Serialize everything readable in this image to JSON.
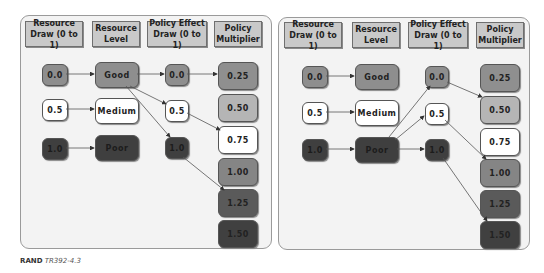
{
  "headers": {
    "resource_draw": "Resource\nDraw (0 to 1)",
    "resource_level": "Resource\nLevel",
    "policy_effect_draw": "Policy Effect\nDraw (0 to 1)",
    "policy_multiplier": "Policy\nMultiplier"
  },
  "left": {
    "draws": [
      "0.0",
      "0.5",
      "1.0"
    ],
    "levels": [
      "Good",
      "Medium",
      "Poor"
    ],
    "policy_draws": [
      "0.0",
      "0.5",
      "1.0"
    ],
    "multipliers": [
      "0.25",
      "0.50",
      "0.75",
      "1.00",
      "1.25",
      "1.50"
    ]
  },
  "right": {
    "draws": [
      "0.0",
      "0.5",
      "1.0"
    ],
    "levels": [
      "Good",
      "Medium",
      "Poor"
    ],
    "policy_draws": [
      "0.0",
      "0.5",
      "1.0"
    ],
    "multipliers": [
      "0.25",
      "0.50",
      "0.75",
      "1.00",
      "1.25",
      "1.50"
    ]
  },
  "diagram": {
    "left_edges": [
      [
        "Draw 0.0",
        "Good"
      ],
      [
        "Draw 0.5",
        "Medium"
      ],
      [
        "Draw 1.0",
        "Poor"
      ],
      [
        "Good",
        "Policy 0.0"
      ],
      [
        "Good",
        "Policy 0.5"
      ],
      [
        "Good",
        "Policy 1.0"
      ],
      [
        "Policy 0.0",
        "0.25"
      ],
      [
        "Policy 0.5",
        "0.75"
      ],
      [
        "Policy 1.0",
        "1.25"
      ]
    ],
    "right_edges": [
      [
        "Draw 0.0",
        "Good"
      ],
      [
        "Draw 0.5",
        "Medium"
      ],
      [
        "Draw 1.0",
        "Poor"
      ],
      [
        "Poor",
        "Policy 0.0"
      ],
      [
        "Poor",
        "Policy 0.5"
      ],
      [
        "Poor",
        "Policy 1.0"
      ],
      [
        "Policy 0.0",
        "0.50"
      ],
      [
        "Policy 0.5",
        "1.00"
      ],
      [
        "Policy 1.0",
        "1.50"
      ]
    ]
  },
  "caption": {
    "org": "RAND",
    "id": "TR392-4.3"
  }
}
